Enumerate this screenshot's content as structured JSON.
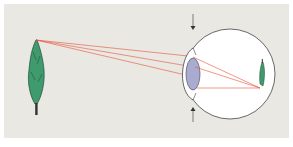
{
  "diagram": {
    "title": "",
    "colors": {
      "background": "#e9e8e2",
      "panel_border": "#ffffff",
      "tree_fill": "#3f9a6e",
      "tree_stroke": "#1f4a35",
      "trunk": "#333333",
      "ray": "#e8503a",
      "eye_fill": "#ffffff",
      "eye_stroke": "#444444",
      "lens_fill": "#a9abd0",
      "lens_stroke": "#555566",
      "arrow": "#333333"
    },
    "labels": []
  }
}
